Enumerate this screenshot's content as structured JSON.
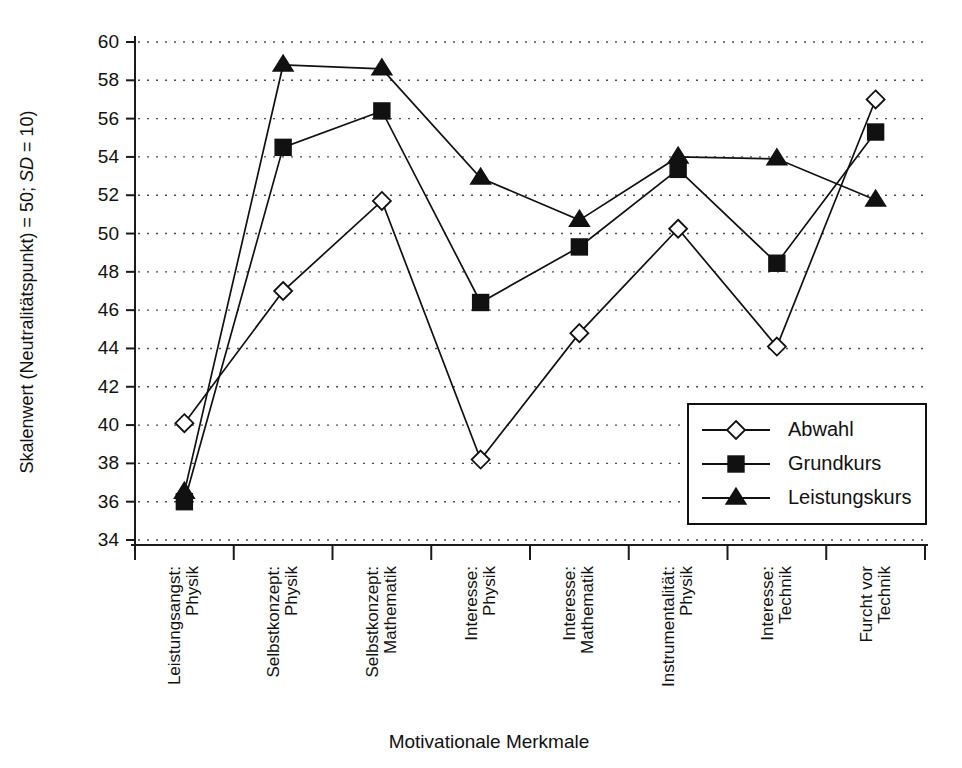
{
  "chart_data": {
    "type": "line",
    "title": "",
    "xlabel": "Motivationale Merkmale",
    "ylabel": "Skalenwert (Neutralitätspunkt) = 50; SD = 10)",
    "ylabel_parts": {
      "pre": "Skalenwert (Neutralitätspunkt) = 50; ",
      "italic": "SD",
      "post": " = 10)"
    },
    "ylim": [
      34,
      60
    ],
    "ytick_step": 2,
    "yticks": [
      "34",
      "36",
      "38",
      "40",
      "42",
      "44",
      "46",
      "48",
      "50",
      "52",
      "54",
      "56",
      "58",
      "60"
    ],
    "grid": true,
    "legend_position": "bottom-right",
    "categories": [
      "Leistungsangst:\nPhysik",
      "Selbstkonzept:\nPhysik",
      "Selbstkonzept:\nMathematik",
      "Interesse:\nPhysik",
      "Interesse:\nMathematik",
      "Instrumentalität:\nPhysik",
      "Interesse:\nTechnik",
      "Furcht vor\nTechnik"
    ],
    "category_lines": [
      [
        "Leistungsangst:",
        "Physik"
      ],
      [
        "Selbstkonzept:",
        "Physik"
      ],
      [
        "Selbstkonzept:",
        "Mathematik"
      ],
      [
        "Interesse:",
        "Physik"
      ],
      [
        "Interesse:",
        "Mathematik"
      ],
      [
        "Instrumentalität:",
        "Physik"
      ],
      [
        "Interesse:",
        "Technik"
      ],
      [
        "Furcht vor",
        "Technik"
      ]
    ],
    "series": [
      {
        "name": "Abwahl",
        "marker": "open-diamond",
        "values": [
          40.1,
          47.0,
          51.7,
          38.2,
          44.8,
          50.25,
          44.1,
          57.0
        ]
      },
      {
        "name": "Grundkurs",
        "marker": "filled-square",
        "values": [
          36.0,
          54.5,
          56.4,
          46.4,
          49.3,
          53.35,
          48.45,
          55.3
        ]
      },
      {
        "name": "Leistungskurs",
        "marker": "filled-triangle",
        "values": [
          36.5,
          58.8,
          58.6,
          52.9,
          50.7,
          54.0,
          53.9,
          51.75
        ]
      }
    ]
  },
  "legend": {
    "entries": [
      "Abwahl",
      "Grundkurs",
      "Leistungskurs"
    ]
  },
  "axis_titles": {
    "x": "Motivationale Merkmale"
  }
}
